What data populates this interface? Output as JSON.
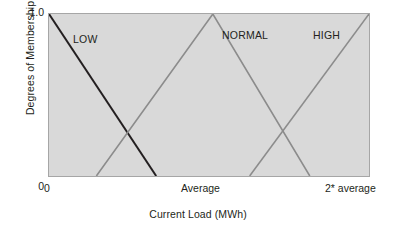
{
  "chart_data": {
    "type": "line",
    "title": "",
    "subtitle": "",
    "xlabel": "Current Load (MWh)",
    "ylabel": "Degrees of Membership",
    "grid": false,
    "legend_position": "inside-plot-annotations",
    "xlim": [
      0,
      1
    ],
    "ylim": [
      0,
      1
    ],
    "x_tick_labels": [
      "0",
      "Average",
      "2* average"
    ],
    "x_tick_positions": [
      0,
      0.5,
      1
    ],
    "y_tick_labels": [
      "0",
      "1.0"
    ],
    "y_tick_positions": [
      0,
      1
    ],
    "annotations": [
      {
        "text": "LOW",
        "x": 0.078,
        "y": 0.88
      },
      {
        "text": "NORMAL",
        "x": 0.54,
        "y": 0.905
      },
      {
        "text": "HIGH",
        "x": 0.823,
        "y": 0.905
      }
    ],
    "series": [
      {
        "name": "LOW",
        "color": "#231f20",
        "width": 2.0,
        "points": [
          [
            0,
            1.0
          ],
          [
            0.335,
            0
          ]
        ]
      },
      {
        "name": "NORMAL",
        "color": "#8c8c8c",
        "width": 1.6,
        "points": [
          [
            0.148,
            0
          ],
          [
            0.512,
            1.0
          ],
          [
            0.815,
            0
          ]
        ]
      },
      {
        "name": "HIGH",
        "color": "#8c8c8c",
        "width": 1.6,
        "points": [
          [
            0.627,
            0
          ],
          [
            1.0,
            1.0
          ]
        ]
      }
    ]
  },
  "axes": {
    "y_title": "Degrees of Membership",
    "y_tick_top": "1.0",
    "y_tick_bottom": "0",
    "x_title": "Current Load (MWh)",
    "x_tick_left": "0",
    "x_tick_middle": "Average",
    "x_tick_right": "2* average"
  },
  "set_labels": {
    "low": "LOW",
    "normal": "NORMAL",
    "high": "HIGH"
  },
  "colors": {
    "plot_background": "#d9d9d9",
    "plot_border": "#a6a6a6",
    "low_line": "#231f20",
    "normal_line": "#8c8c8c",
    "high_line": "#8c8c8c",
    "text": "#231f20",
    "page_background": "#ffffff"
  }
}
